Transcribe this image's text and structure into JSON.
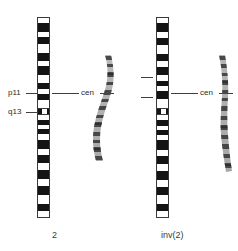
{
  "figure": {
    "title_left": "2",
    "title_right": "inv(2)",
    "background_color": "#ffffff",
    "band_dark_color": "#141414",
    "band_light_color": "#ffffff",
    "outline_color": "#3a3a3a",
    "leader_color": "#3f3f3f",
    "text_color": "#2b2b2b"
  },
  "left_panel": {
    "caption": "2",
    "labels": [
      {
        "text": "p11",
        "x": 8,
        "y": 88
      },
      {
        "text": "q13",
        "x": 8,
        "y": 107
      }
    ],
    "cen_label": {
      "text": "cen",
      "x": 83,
      "y": 88
    },
    "ideogram": {
      "name": "chromosome-2-ideogram",
      "top": 17,
      "height": 201,
      "centromere_top": 90,
      "centromere_height": 7,
      "bands": [
        {
          "type": "light",
          "top": 0,
          "height": 5
        },
        {
          "type": "dark",
          "top": 5,
          "height": 9
        },
        {
          "type": "light",
          "top": 14,
          "height": 5
        },
        {
          "type": "dark",
          "top": 19,
          "height": 7
        },
        {
          "type": "light",
          "top": 26,
          "height": 9
        },
        {
          "type": "dark",
          "top": 35,
          "height": 8
        },
        {
          "type": "light",
          "top": 43,
          "height": 5
        },
        {
          "type": "dark",
          "top": 48,
          "height": 9
        },
        {
          "type": "light",
          "top": 57,
          "height": 8
        },
        {
          "type": "dark",
          "top": 65,
          "height": 6
        },
        {
          "type": "light",
          "top": 71,
          "height": 5
        },
        {
          "type": "dark",
          "top": 76,
          "height": 6
        },
        {
          "type": "light",
          "top": 82,
          "height": 8
        },
        {
          "type": "light",
          "top": 97,
          "height": 5
        },
        {
          "type": "dark",
          "top": 102,
          "height": 5
        },
        {
          "type": "light",
          "top": 107,
          "height": 4
        },
        {
          "type": "dark",
          "top": 111,
          "height": 5
        },
        {
          "type": "light",
          "top": 116,
          "height": 6
        },
        {
          "type": "dark",
          "top": 122,
          "height": 9
        },
        {
          "type": "light",
          "top": 131,
          "height": 6
        },
        {
          "type": "dark",
          "top": 137,
          "height": 8
        },
        {
          "type": "light",
          "top": 145,
          "height": 7
        },
        {
          "type": "dark",
          "top": 152,
          "height": 9
        },
        {
          "type": "light",
          "top": 161,
          "height": 7
        },
        {
          "type": "dark",
          "top": 168,
          "height": 9
        },
        {
          "type": "light",
          "top": 177,
          "height": 9
        },
        {
          "type": "dark",
          "top": 186,
          "height": 7
        },
        {
          "type": "light",
          "top": 193,
          "height": 8
        }
      ]
    },
    "photo_chromosome": {
      "name": "banded-chromosome-photo-normal",
      "left": 88,
      "top": 55,
      "width": 28,
      "height": 108,
      "shape": "curved"
    }
  },
  "right_panel": {
    "caption": "inv(2)",
    "cen_label": {
      "text": "cen",
      "x": 83,
      "y": 88
    },
    "ticks": [
      {
        "y": 77
      },
      {
        "y": 97
      }
    ],
    "ideogram": {
      "name": "chromosome-inv2-ideogram",
      "top": 17,
      "height": 201,
      "centromere_top": 90,
      "centromere_height": 7,
      "bands": [
        {
          "type": "light",
          "top": 0,
          "height": 5
        },
        {
          "type": "dark",
          "top": 5,
          "height": 9
        },
        {
          "type": "light",
          "top": 14,
          "height": 6
        },
        {
          "type": "dark",
          "top": 20,
          "height": 7
        },
        {
          "type": "light",
          "top": 27,
          "height": 9
        },
        {
          "type": "dark",
          "top": 36,
          "height": 7
        },
        {
          "type": "light",
          "top": 43,
          "height": 6
        },
        {
          "type": "dark",
          "top": 49,
          "height": 8
        },
        {
          "type": "light",
          "top": 57,
          "height": 6
        },
        {
          "type": "dark",
          "top": 63,
          "height": 5
        },
        {
          "type": "light",
          "top": 68,
          "height": 5
        },
        {
          "type": "dark",
          "top": 73,
          "height": 8
        },
        {
          "type": "light",
          "top": 81,
          "height": 9
        },
        {
          "type": "light",
          "top": 97,
          "height": 5
        },
        {
          "type": "dark",
          "top": 102,
          "height": 6
        },
        {
          "type": "light",
          "top": 108,
          "height": 4
        },
        {
          "type": "dark",
          "top": 112,
          "height": 5
        },
        {
          "type": "light",
          "top": 117,
          "height": 5
        },
        {
          "type": "dark",
          "top": 122,
          "height": 10
        },
        {
          "type": "light",
          "top": 132,
          "height": 6
        },
        {
          "type": "dark",
          "top": 138,
          "height": 8
        },
        {
          "type": "light",
          "top": 146,
          "height": 7
        },
        {
          "type": "dark",
          "top": 153,
          "height": 9
        },
        {
          "type": "light",
          "top": 162,
          "height": 7
        },
        {
          "type": "dark",
          "top": 169,
          "height": 8
        },
        {
          "type": "light",
          "top": 177,
          "height": 9
        },
        {
          "type": "dark",
          "top": 186,
          "height": 7
        },
        {
          "type": "light",
          "top": 193,
          "height": 8
        }
      ]
    },
    "photo_chromosome": {
      "name": "banded-chromosome-photo-inverted",
      "left": 207,
      "top": 55,
      "width": 26,
      "height": 118,
      "shape": "straight"
    }
  }
}
